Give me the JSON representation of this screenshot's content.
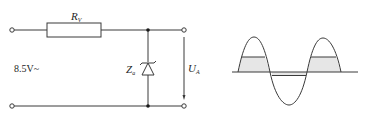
{
  "circuit": {
    "resistor": {
      "symbol": "R",
      "subscript": "V"
    },
    "zener": {
      "symbol": "Z",
      "subscript": "a"
    },
    "source_label": "8.5V~",
    "output": {
      "symbol": "U",
      "subscript": "A"
    }
  },
  "waveform": {
    "description": "Sine input clipped by Zener diode: positive half-waves limited at Zener voltage (shaded), negative half-waves clamped at forward voltage",
    "shaded_fill": "#e6e6e6",
    "line_color": "#3a3a3a"
  },
  "colors": {
    "stroke": "#3a3a3a",
    "background": "#ffffff",
    "text": "#1f1f1f"
  }
}
